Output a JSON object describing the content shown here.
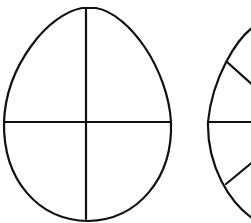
{
  "diagram": {
    "stroke_color": "#111111",
    "background": "#ffffff",
    "shapes": [
      {
        "name": "egg-quartered",
        "divisions": 4,
        "lines": [
          "vertical",
          "horizontal"
        ]
      },
      {
        "name": "egg-sectioned-partial",
        "divisions": "partially visible",
        "lines": [
          "horizontal",
          "diagonal-upper",
          "diagonal-lower"
        ]
      }
    ]
  }
}
